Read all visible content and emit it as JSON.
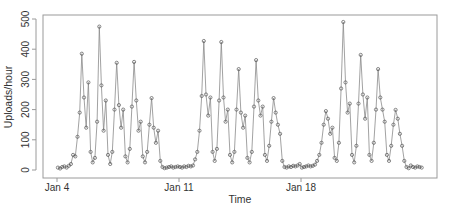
{
  "chart_data": {
    "type": "line",
    "title": "",
    "xlabel": "Time",
    "ylabel": "Uploads/hour",
    "ylim": [
      0,
      500
    ],
    "yticks": [
      0,
      100,
      200,
      300,
      400,
      500
    ],
    "xticks": [
      {
        "label": "Jan 4",
        "day": 0
      },
      {
        "label": "Jan 11",
        "day": 7
      },
      {
        "label": "Jan 18",
        "day": 14
      }
    ],
    "grid": false,
    "legend": null,
    "marker": "open-circle",
    "series": [
      {
        "name": "Uploads/hour",
        "sample_interval_hours": 3,
        "start": "Jan 4 00:00",
        "values": [
          8,
          5,
          10,
          12,
          8,
          14,
          20,
          50,
          45,
          110,
          190,
          385,
          240,
          140,
          290,
          60,
          25,
          40,
          160,
          475,
          280,
          130,
          230,
          50,
          20,
          60,
          200,
          355,
          215,
          140,
          200,
          45,
          25,
          70,
          210,
          358,
          230,
          130,
          160,
          45,
          25,
          60,
          150,
          238,
          140,
          90,
          130,
          30,
          10,
          6,
          8,
          10,
          12,
          8,
          10,
          12,
          10,
          8,
          12,
          10,
          14,
          12,
          15,
          35,
          60,
          130,
          245,
          427,
          250,
          180,
          240,
          60,
          30,
          70,
          230,
          424,
          240,
          160,
          200,
          50,
          25,
          60,
          200,
          334,
          190,
          140,
          180,
          40,
          25,
          60,
          210,
          364,
          230,
          180,
          210,
          50,
          30,
          80,
          160,
          238,
          190,
          150,
          120,
          30,
          10,
          8,
          12,
          10,
          14,
          12,
          15,
          20,
          8,
          10,
          12,
          15,
          12,
          14,
          18,
          30,
          50,
          90,
          150,
          195,
          170,
          120,
          140,
          40,
          30,
          90,
          270,
          490,
          290,
          190,
          220,
          50,
          25,
          80,
          220,
          381,
          250,
          170,
          240,
          50,
          30,
          90,
          200,
          334,
          240,
          200,
          160,
          50,
          30,
          80,
          150,
          199,
          170,
          120,
          80,
          30,
          10,
          6,
          15,
          10,
          8,
          12,
          10,
          8
        ]
      }
    ]
  },
  "axes": {
    "ylabel": "Uploads/hour",
    "xlabel": "Time",
    "ytick_labels": [
      "0",
      "100",
      "200",
      "300",
      "400",
      "500"
    ],
    "xtick_labels": [
      "Jan 4",
      "Jan 11",
      "Jan 18"
    ]
  }
}
